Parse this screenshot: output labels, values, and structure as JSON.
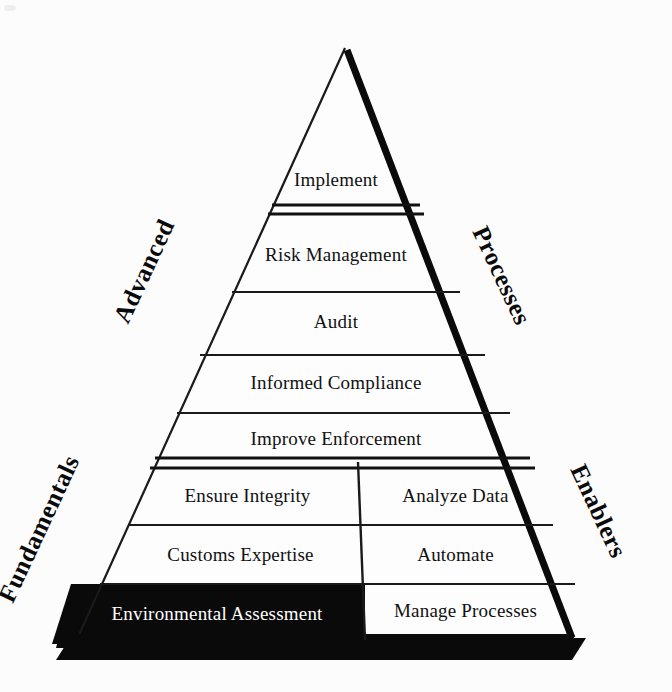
{
  "diagram": {
    "type": "pyramid",
    "title": "",
    "shape": {
      "apex": {
        "x": 345,
        "y": 48
      },
      "base_left": {
        "x": 78,
        "y": 636
      },
      "base_right": {
        "x": 570,
        "y": 636
      },
      "background_color": "#fcfcfc",
      "outline_color": "#111111",
      "shadow_color": "#000000"
    },
    "side_labels": [
      {
        "id": "advanced",
        "text": "Advanced",
        "side": "left",
        "section": "upper"
      },
      {
        "id": "processes",
        "text": "Processes",
        "side": "right",
        "section": "upper"
      },
      {
        "id": "fundamentals",
        "text": "Fundamentals",
        "side": "left",
        "section": "lower"
      },
      {
        "id": "enablers",
        "text": "Enablers",
        "side": "right",
        "section": "lower"
      }
    ],
    "sections": [
      {
        "id": "advanced-section",
        "name": "Advanced",
        "columns": 1,
        "rows": [
          {
            "id": "implement",
            "text": "Implement",
            "highlight": false
          },
          {
            "id": "risk-management",
            "text": "Risk Management",
            "highlight": false
          },
          {
            "id": "audit",
            "text": "Audit",
            "highlight": false
          },
          {
            "id": "informed-compliance",
            "text": "Informed Compliance",
            "highlight": false
          },
          {
            "id": "improve-enforcement",
            "text": "Improve Enforcement",
            "highlight": false
          }
        ]
      },
      {
        "id": "fundamentals-section",
        "name": "Fundamentals",
        "columns": 2,
        "rows": [
          {
            "id": "row-integrity",
            "left": {
              "id": "ensure-integrity",
              "text": "Ensure Integrity",
              "highlight": false
            },
            "right": {
              "id": "analyze-data",
              "text": "Analyze Data",
              "highlight": false
            }
          },
          {
            "id": "row-expertise",
            "left": {
              "id": "customs-expertise",
              "text": "Customs Expertise",
              "highlight": false
            },
            "right": {
              "id": "automate",
              "text": "Automate",
              "highlight": false
            }
          },
          {
            "id": "row-environmental",
            "left": {
              "id": "environmental-assessment",
              "text": "Environmental Assessment",
              "highlight": true
            },
            "right": {
              "id": "manage-processes",
              "text": "Manage Processes",
              "highlight": false
            }
          }
        ]
      }
    ],
    "separators": [
      {
        "id": "sep-implement",
        "style": "double",
        "after_row": "implement"
      },
      {
        "id": "sep-risk",
        "style": "single",
        "after_row": "risk-management"
      },
      {
        "id": "sep-audit",
        "style": "single",
        "after_row": "audit"
      },
      {
        "id": "sep-informed",
        "style": "single",
        "after_row": "informed-compliance"
      },
      {
        "id": "sep-section",
        "style": "double",
        "after_row": "improve-enforcement"
      },
      {
        "id": "sep-integrity",
        "style": "single",
        "after_row": "row-integrity"
      },
      {
        "id": "sep-expertise",
        "style": "single",
        "after_row": "row-expertise"
      },
      {
        "id": "sep-vertical",
        "style": "vertical-divider",
        "after_row": ""
      }
    ]
  }
}
